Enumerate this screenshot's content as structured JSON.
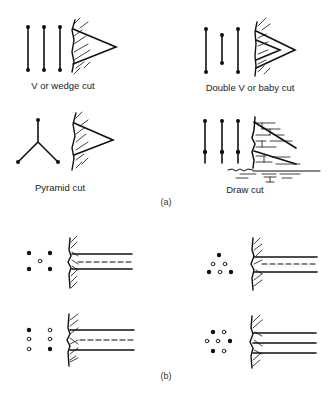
{
  "figure": {
    "part_a": {
      "label": "(a)",
      "panels": [
        {
          "id": "v-wedge",
          "caption": "V or wedge cut"
        },
        {
          "id": "double-v",
          "caption": "Double V or baby cut"
        },
        {
          "id": "pyramid",
          "caption": "Pyramid cut"
        },
        {
          "id": "draw",
          "caption": "Draw cut"
        }
      ]
    },
    "part_b": {
      "label": "(b)",
      "panels": [
        {
          "id": "b1",
          "filled_holes": 4,
          "open_holes": 1
        },
        {
          "id": "b2",
          "filled_holes": 2,
          "open_holes": 4
        },
        {
          "id": "b3",
          "filled_holes": 3,
          "open_holes": 3
        },
        {
          "id": "b4",
          "filled_holes": 3,
          "open_holes": 4
        }
      ]
    }
  },
  "colors": {
    "ink": "#111111",
    "background": "#ffffff"
  }
}
